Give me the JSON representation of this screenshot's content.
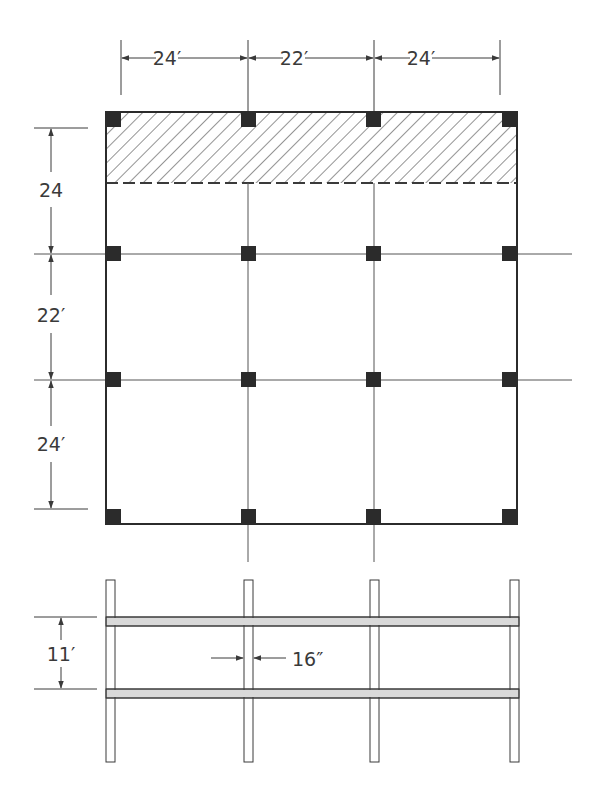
{
  "figure": {
    "plan": {
      "bay_widths": [
        "24′",
        "22′",
        "24′"
      ],
      "bay_depths": [
        "24",
        "22′",
        "24′"
      ],
      "hatched_area": "shaded strip along top edge, bounded by dashed line",
      "column_grid": {
        "columns_x": 4,
        "rows_y": 4
      }
    },
    "elevation": {
      "story_height": "11′",
      "column_width": "16″",
      "floors": 2,
      "posts": 4
    }
  },
  "labels": {
    "top_dim_1": "24′",
    "top_dim_2": "22′",
    "top_dim_3": "24′",
    "left_dim_1": "24",
    "left_dim_2": "22′",
    "left_dim_3": "24′",
    "elev_height": "11′",
    "elev_col_width": "16″"
  },
  "colors": {
    "line": "#3a3a3a",
    "column_fill": "#2b2b2b",
    "beam_fill": "#d9d9d9",
    "background": "#ffffff"
  }
}
